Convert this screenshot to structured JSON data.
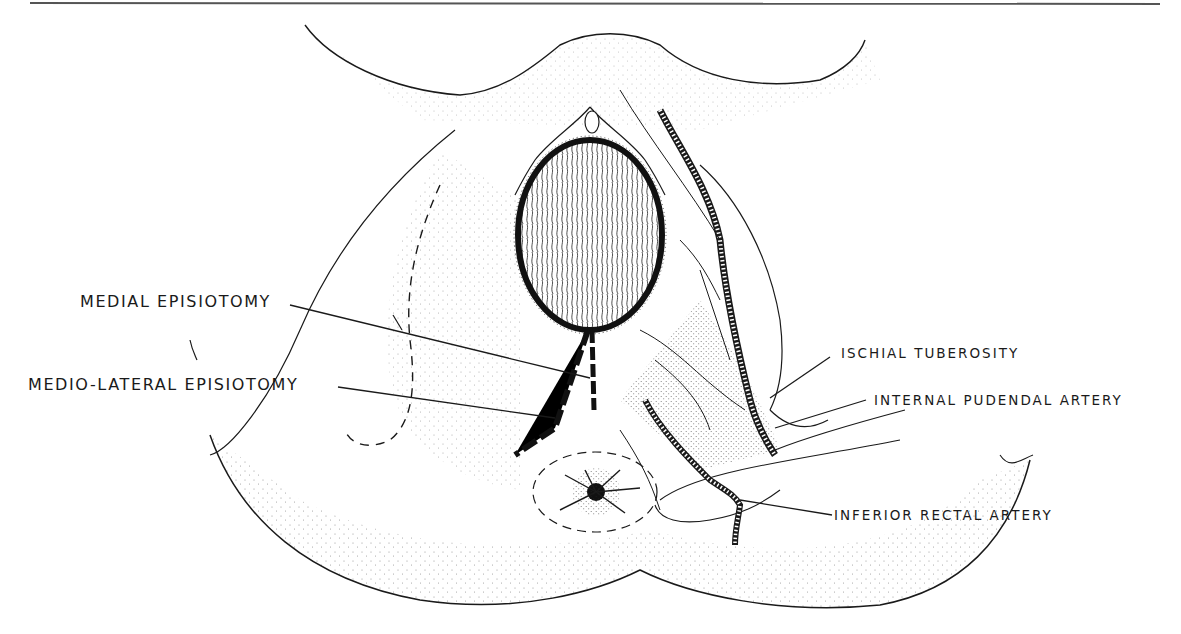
{
  "figure": {
    "type": "anatomical line drawing",
    "ink_color": "#1a1a1a",
    "background_color": "#ffffff"
  },
  "labels": {
    "medial_episiotomy": "MEDIAL EPISIOTOMY",
    "medio_lateral_episiotomy": "MEDIO-LATERAL EPISIOTOMY",
    "ischial_tuberosity": "ISCHIAL TUBEROSITY",
    "internal_pudendal_artery": "INTERNAL PUDENDAL ARTERY",
    "inferior_rectal_artery": "INFERIOR RECTAL ARTERY"
  }
}
